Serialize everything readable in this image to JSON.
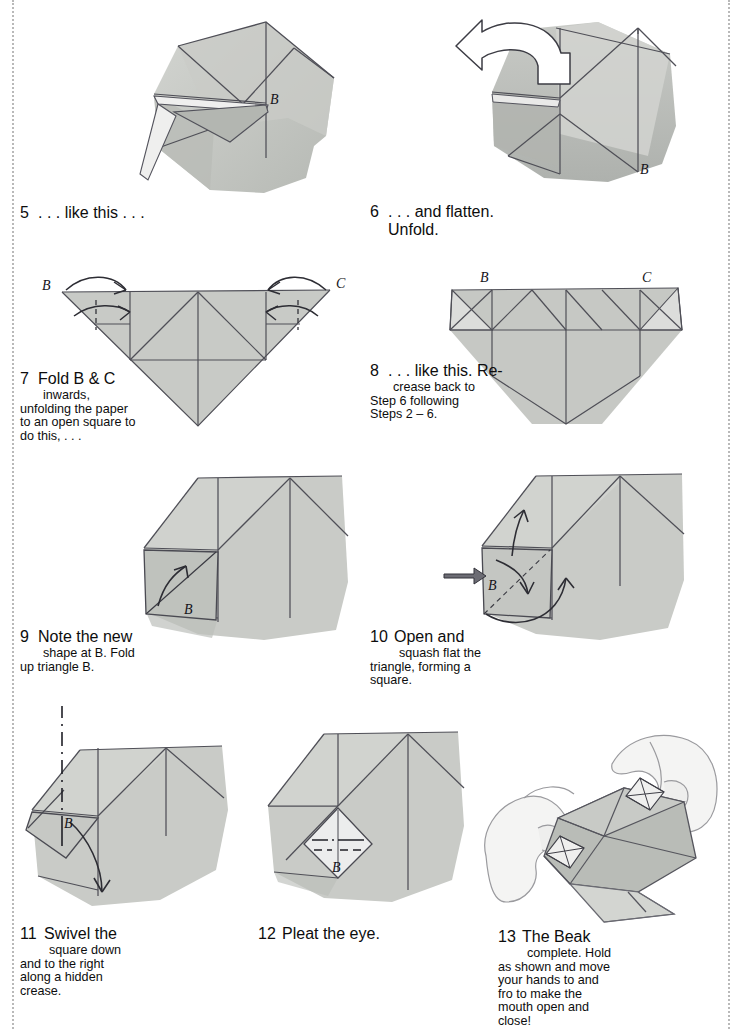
{
  "page": {
    "margin_rule_style": "dotted",
    "paper_color": "#ffffff",
    "ink_color": "#111111",
    "wash_light": "#d9dad6",
    "wash_mid": "#c2c4c0",
    "wash_dark": "#a9aca8",
    "line_color": "#4a4a52"
  },
  "steps": [
    {
      "number": "5",
      "bar_width": 13,
      "first_line": ". . . like this . . .",
      "rest_lines": [],
      "figure": {
        "name": "step5-diagram",
        "labels": [
          "B"
        ],
        "arrows": [],
        "description": "folded square with raised flap, point B at right of centre"
      }
    },
    {
      "number": "6",
      "bar_width": 13,
      "first_line": ". . . and flatten.",
      "rest_lines": [
        "Unfold."
      ],
      "figure": {
        "name": "step6-diagram",
        "labels": [
          "B"
        ],
        "arrows": [
          "unfold-turn-arrow-left"
        ],
        "description": "flattened model with large white hollow unfold arrow pointing left"
      }
    },
    {
      "number": "7",
      "bar_width": 13,
      "first_line": "Fold B & C",
      "rest_lines": [
        "inwards,",
        "unfolding the paper",
        "to an open square to",
        "do this, . . ."
      ],
      "figure": {
        "name": "step7-diagram",
        "labels": [
          "B",
          "C"
        ],
        "arrows": [
          "fold-arrow-left",
          "fold-arrow-right",
          "return-arrow-left",
          "return-arrow-right"
        ],
        "description": "downward triangle with creases, B top-left, C top-right"
      }
    },
    {
      "number": "8",
      "bar_width": 13,
      "first_line": ". . . like this. Re-",
      "rest_lines": [
        "crease back to",
        "Step 6 following",
        "Steps 2 – 6."
      ],
      "figure": {
        "name": "step8-diagram",
        "labels": [
          "B",
          "C"
        ],
        "arrows": [],
        "description": "pentagon-shaped folded paper with open squares at B and C"
      }
    },
    {
      "number": "9",
      "bar_width": 13,
      "first_line": "Note the new",
      "rest_lines": [
        "shape at B. Fold",
        "up triangle B."
      ],
      "figure": {
        "name": "step9-diagram",
        "labels": [
          "B"
        ],
        "arrows": [
          "fold-up-arrow"
        ],
        "description": "square model, small square at lower left with valley fold and up arrow"
      }
    },
    {
      "number": "10",
      "bar_width": 19,
      "first_line": "Open and",
      "rest_lines": [
        "squash flat the",
        "triangle, forming a",
        "square."
      ],
      "figure": {
        "name": "step10-diagram",
        "labels": [
          "B"
        ],
        "arrows": [
          "push-in-arrow",
          "open-arrow-up",
          "squash-arrow-curved"
        ],
        "description": "square model with push arrow at left edge and squash-fold arrows"
      }
    },
    {
      "number": "11",
      "bar_width": 19,
      "first_line": "Swivel the",
      "rest_lines": [
        "square down",
        "and to the right",
        "along a hidden",
        "crease."
      ],
      "figure": {
        "name": "step11-diagram",
        "labels": [
          "B"
        ],
        "arrows": [
          "swivel-arrow-down"
        ],
        "description": "model with dash-dot axis line above and curved swivel arrow downward"
      }
    },
    {
      "number": "12",
      "bar_width": 19,
      "first_line": "Pleat the eye.",
      "rest_lines": [],
      "figure": {
        "name": "step12-diagram",
        "labels": [
          "B"
        ],
        "arrows": [],
        "description": "model with white diamond eye marked with pleat (dashed and dash-dot) lines"
      }
    },
    {
      "number": "13",
      "bar_width": 19,
      "first_line": "The Beak",
      "rest_lines": [
        "complete. Hold",
        "as shown and move",
        "your hands to and",
        "fro to make the",
        "mouth open and",
        "close!"
      ],
      "figure": {
        "name": "step13-diagram",
        "labels": [],
        "arrows": [],
        "description": "two hands holding the completed beak, pleated eyes on both sides"
      }
    }
  ]
}
